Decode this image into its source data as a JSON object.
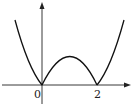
{
  "figure": {
    "type": "function-graph",
    "axes": {
      "x_arrow": true,
      "y_arrow": true
    },
    "tick_labels": {
      "origin": "0",
      "x_two": "2"
    },
    "key_points": [
      {
        "x": 0,
        "y": 0,
        "label": "0"
      },
      {
        "x": 2,
        "y": 0,
        "label": "2"
      },
      {
        "x": 1,
        "y": 1,
        "label": ""
      }
    ],
    "colors": {
      "stroke": "#1a1a1a",
      "background": "#ffffff"
    }
  }
}
